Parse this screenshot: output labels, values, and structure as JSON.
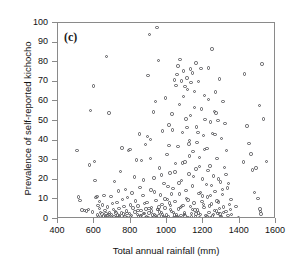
{
  "chart_data": {
    "type": "scatter",
    "title": "",
    "panel_label": "(c)",
    "xlabel": "Total annual rainfall (mm)",
    "ylabel": "Prevalence of self-reported kichocho",
    "xlim": [
      400,
      1600
    ],
    "ylim": [
      0,
      100
    ],
    "xticks": [
      400,
      600,
      800,
      1000,
      1200,
      1400,
      1600
    ],
    "yticks": [
      0,
      10,
      20,
      30,
      40,
      50,
      60,
      70,
      80,
      90,
      100
    ],
    "grid": false,
    "legend": null,
    "marker": "open-circle",
    "marker_color": "#58585c",
    "frame": "box",
    "points": [
      [
        505,
        35.0
      ],
      [
        512,
        11.2
      ],
      [
        520,
        9.5
      ],
      [
        533,
        4.6
      ],
      [
        545,
        4.3
      ],
      [
        556,
        4.1
      ],
      [
        568,
        5.0
      ],
      [
        575,
        27.6
      ],
      [
        580,
        55.5
      ],
      [
        590,
        3.6
      ],
      [
        596,
        67.8
      ],
      [
        600,
        29.4
      ],
      [
        604,
        19.8
      ],
      [
        610,
        10.9
      ],
      [
        614,
        11.6
      ],
      [
        618,
        2.1
      ],
      [
        620,
        6.8
      ],
      [
        624,
        1.2
      ],
      [
        628,
        5.5
      ],
      [
        630,
        9.0
      ],
      [
        634,
        3.4
      ],
      [
        638,
        0.8
      ],
      [
        642,
        2.6
      ],
      [
        646,
        7.2
      ],
      [
        650,
        1.5
      ],
      [
        654,
        12.1
      ],
      [
        658,
        4.4
      ],
      [
        660,
        0.5
      ],
      [
        664,
        2.9
      ],
      [
        668,
        83.0
      ],
      [
        672,
        6.1
      ],
      [
        676,
        1.8
      ],
      [
        680,
        54.0
      ],
      [
        684,
        3.2
      ],
      [
        688,
        0.9
      ],
      [
        692,
        11.4
      ],
      [
        696,
        2.3
      ],
      [
        700,
        7.8
      ],
      [
        704,
        4.9
      ],
      [
        708,
        1.1
      ],
      [
        712,
        19.0
      ],
      [
        716,
        3.7
      ],
      [
        720,
        0.6
      ],
      [
        724,
        8.4
      ],
      [
        728,
        2.0
      ],
      [
        732,
        14.2
      ],
      [
        736,
        5.3
      ],
      [
        740,
        1.7
      ],
      [
        744,
        24.3
      ],
      [
        748,
        3.0
      ],
      [
        752,
        36.2
      ],
      [
        756,
        9.8
      ],
      [
        760,
        2.5
      ],
      [
        764,
        6.4
      ],
      [
        768,
        1.3
      ],
      [
        772,
        15.1
      ],
      [
        776,
        4.0
      ],
      [
        780,
        0.7
      ],
      [
        784,
        11.0
      ],
      [
        788,
        34.8
      ],
      [
        792,
        2.8
      ],
      [
        796,
        35.4
      ],
      [
        800,
        7.1
      ],
      [
        804,
        1.9
      ],
      [
        808,
        13.3
      ],
      [
        812,
        5.7
      ],
      [
        816,
        0.4
      ],
      [
        820,
        21.5
      ],
      [
        824,
        3.5
      ],
      [
        828,
        9.2
      ],
      [
        832,
        30.1
      ],
      [
        836,
        2.2
      ],
      [
        840,
        6.6
      ],
      [
        844,
        1.0
      ],
      [
        848,
        43.3
      ],
      [
        852,
        16.0
      ],
      [
        856,
        4.2
      ],
      [
        860,
        29.7
      ],
      [
        864,
        0.3
      ],
      [
        868,
        11.9
      ],
      [
        872,
        2.7
      ],
      [
        876,
        8.0
      ],
      [
        880,
        38.0
      ],
      [
        884,
        5.1
      ],
      [
        888,
        1.4
      ],
      [
        892,
        42.0
      ],
      [
        896,
        73.2
      ],
      [
        900,
        3.1
      ],
      [
        904,
        94.0
      ],
      [
        908,
        40.5
      ],
      [
        912,
        14.8
      ],
      [
        916,
        6.0
      ],
      [
        920,
        0.9
      ],
      [
        924,
        54.6
      ],
      [
        928,
        21.0
      ],
      [
        932,
        2.4
      ],
      [
        936,
        60.0
      ],
      [
        940,
        9.4
      ],
      [
        944,
        97.8
      ],
      [
        948,
        4.8
      ],
      [
        952,
        80.8
      ],
      [
        956,
        1.6
      ],
      [
        960,
        26.0
      ],
      [
        964,
        12.3
      ],
      [
        968,
        3.3
      ],
      [
        972,
        7.5
      ],
      [
        976,
        45.0
      ],
      [
        980,
        0.5
      ],
      [
        984,
        18.2
      ],
      [
        988,
        5.6
      ],
      [
        992,
        61.8
      ],
      [
        996,
        2.0
      ],
      [
        1000,
        33.0
      ],
      [
        1004,
        10.1
      ],
      [
        1008,
        1.2
      ],
      [
        1012,
        48.0
      ],
      [
        1016,
        23.4
      ],
      [
        1020,
        6.9
      ],
      [
        1024,
        3.8
      ],
      [
        1028,
        53.5
      ],
      [
        1032,
        15.5
      ],
      [
        1036,
        0.8
      ],
      [
        1040,
        71.0
      ],
      [
        1044,
        8.8
      ],
      [
        1048,
        28.3
      ],
      [
        1052,
        2.1
      ],
      [
        1056,
        73.8
      ],
      [
        1060,
        37.0
      ],
      [
        1064,
        5.2
      ],
      [
        1068,
        12.7
      ],
      [
        1072,
        81.5
      ],
      [
        1076,
        1.7
      ],
      [
        1080,
        19.6
      ],
      [
        1084,
        44.2
      ],
      [
        1088,
        7.0
      ],
      [
        1092,
        75.5
      ],
      [
        1096,
        3.0
      ],
      [
        1100,
        29.0
      ],
      [
        1104,
        51.0
      ],
      [
        1108,
        10.5
      ],
      [
        1112,
        66.0
      ],
      [
        1116,
        0.6
      ],
      [
        1120,
        23.0
      ],
      [
        1124,
        40.0
      ],
      [
        1128,
        6.3
      ],
      [
        1132,
        69.5
      ],
      [
        1136,
        2.9
      ],
      [
        1140,
        16.8
      ],
      [
        1144,
        34.5
      ],
      [
        1148,
        8.2
      ],
      [
        1152,
        57.0
      ],
      [
        1156,
        1.1
      ],
      [
        1160,
        25.5
      ],
      [
        1164,
        47.0
      ],
      [
        1168,
        4.5
      ],
      [
        1172,
        70.2
      ],
      [
        1176,
        13.0
      ],
      [
        1180,
        31.5
      ],
      [
        1184,
        2.3
      ],
      [
        1188,
        76.8
      ],
      [
        1192,
        9.0
      ],
      [
        1196,
        20.4
      ],
      [
        1200,
        42.5
      ],
      [
        1204,
        5.8
      ],
      [
        1208,
        63.0
      ],
      [
        1212,
        0.4
      ],
      [
        1216,
        17.5
      ],
      [
        1220,
        36.0
      ],
      [
        1224,
        11.3
      ],
      [
        1228,
        77.0
      ],
      [
        1232,
        3.4
      ],
      [
        1236,
        27.0
      ],
      [
        1240,
        49.5
      ],
      [
        1244,
        7.6
      ],
      [
        1248,
        86.8
      ],
      [
        1252,
        1.5
      ],
      [
        1256,
        22.0
      ],
      [
        1260,
        55.0
      ],
      [
        1264,
        14.0
      ],
      [
        1268,
        64.8
      ],
      [
        1272,
        4.1
      ],
      [
        1276,
        30.8
      ],
      [
        1280,
        50.2
      ],
      [
        1284,
        8.6
      ],
      [
        1288,
        71.5
      ],
      [
        1292,
        2.6
      ],
      [
        1296,
        18.9
      ],
      [
        1300,
        41.0
      ],
      [
        1304,
        12.5
      ],
      [
        1308,
        59.8
      ],
      [
        1312,
        6.2
      ],
      [
        1316,
        26.4
      ],
      [
        1320,
        48.8
      ],
      [
        1324,
        3.7
      ],
      [
        1328,
        34.8
      ],
      [
        1332,
        15.8
      ],
      [
        1336,
        1.9
      ],
      [
        1340,
        18.0
      ],
      [
        1344,
        7.3
      ],
      [
        1348,
        4.7
      ],
      [
        1352,
        10.0
      ],
      [
        1356,
        2.2
      ],
      [
        1380,
        6.4
      ],
      [
        1392,
        0.7
      ],
      [
        1420,
        29.0
      ],
      [
        1428,
        74.0
      ],
      [
        1440,
        47.5
      ],
      [
        1452,
        38.5
      ],
      [
        1462,
        33.2
      ],
      [
        1472,
        25.0
      ],
      [
        1480,
        13.6
      ],
      [
        1490,
        26.0
      ],
      [
        1500,
        10.5
      ],
      [
        1508,
        57.8
      ],
      [
        1512,
        5.2
      ],
      [
        1516,
        3.8
      ],
      [
        1518,
        2.6
      ],
      [
        1522,
        79.0
      ],
      [
        1532,
        51.0
      ],
      [
        1548,
        29.2
      ],
      [
        640,
        0.2
      ],
      [
        660,
        1.0
      ],
      [
        680,
        2.4
      ],
      [
        700,
        0.5
      ],
      [
        720,
        3.0
      ],
      [
        740,
        1.3
      ],
      [
        760,
        0.6
      ],
      [
        780,
        2.8
      ],
      [
        800,
        1.1
      ],
      [
        820,
        0.3
      ],
      [
        840,
        4.2
      ],
      [
        860,
        1.8
      ],
      [
        880,
        0.9
      ],
      [
        900,
        5.5
      ],
      [
        920,
        2.1
      ],
      [
        940,
        0.7
      ],
      [
        960,
        3.6
      ],
      [
        980,
        1.4
      ],
      [
        1000,
        0.2
      ],
      [
        1020,
        4.9
      ],
      [
        1040,
        2.0
      ],
      [
        1060,
        0.8
      ],
      [
        1080,
        6.5
      ],
      [
        1100,
        1.6
      ],
      [
        1120,
        0.4
      ],
      [
        1140,
        5.0
      ],
      [
        1160,
        2.5
      ],
      [
        1180,
        0.9
      ],
      [
        1200,
        7.4
      ],
      [
        1220,
        1.2
      ],
      [
        1240,
        0.6
      ],
      [
        1260,
        4.4
      ],
      [
        1280,
        2.7
      ],
      [
        1300,
        1.0
      ],
      [
        855,
        1.5
      ],
      [
        875,
        2.9
      ],
      [
        895,
        0.8
      ],
      [
        915,
        4.0
      ],
      [
        935,
        1.7
      ],
      [
        955,
        6.2
      ],
      [
        975,
        2.4
      ],
      [
        995,
        0.5
      ],
      [
        1015,
        8.1
      ],
      [
        1035,
        3.3
      ],
      [
        1055,
        1.0
      ],
      [
        1075,
        5.8
      ],
      [
        1095,
        2.2
      ],
      [
        1115,
        9.6
      ],
      [
        1135,
        1.4
      ],
      [
        1155,
        4.6
      ],
      [
        1175,
        3.1
      ],
      [
        1195,
        11.8
      ],
      [
        1215,
        1.9
      ],
      [
        1235,
        6.7
      ],
      [
        1255,
        2.3
      ],
      [
        1275,
        9.1
      ],
      [
        1295,
        1.3
      ],
      [
        1005,
        16.5
      ],
      [
        1025,
        12.8
      ],
      [
        1045,
        24.0
      ],
      [
        1065,
        18.4
      ],
      [
        1085,
        28.6
      ],
      [
        1105,
        14.5
      ],
      [
        1125,
        32.2
      ],
      [
        1145,
        21.8
      ],
      [
        1165,
        39.0
      ],
      [
        1185,
        13.4
      ],
      [
        1205,
        35.5
      ],
      [
        1225,
        24.8
      ],
      [
        1245,
        17.2
      ],
      [
        1265,
        43.0
      ],
      [
        1285,
        20.5
      ],
      [
        1305,
        15.0
      ],
      [
        1325,
        22.6
      ],
      [
        1030,
        45.5
      ],
      [
        1050,
        68.0
      ],
      [
        1070,
        58.5
      ],
      [
        1090,
        62.4
      ],
      [
        1110,
        46.8
      ],
      [
        1130,
        52.8
      ],
      [
        1150,
        65.0
      ],
      [
        1170,
        44.0
      ],
      [
        1190,
        56.2
      ],
      [
        1210,
        50.8
      ],
      [
        1230,
        61.0
      ],
      [
        1250,
        43.5
      ],
      [
        1270,
        54.0
      ],
      [
        870,
        20.0
      ],
      [
        890,
        8.5
      ],
      [
        910,
        31.0
      ],
      [
        930,
        13.8
      ],
      [
        950,
        5.0
      ],
      [
        970,
        22.5
      ],
      [
        990,
        10.2
      ],
      [
        1010,
        37.5
      ],
      [
        1110,
        72.0
      ],
      [
        1130,
        76.5
      ],
      [
        1060,
        78.0
      ],
      [
        1080,
        70.5
      ],
      [
        1100,
        67.5
      ],
      [
        1140,
        74.5
      ],
      [
        1160,
        79.5
      ],
      [
        1120,
        38.2
      ],
      [
        1180,
        26.8
      ],
      [
        1240,
        12.0
      ],
      [
        1290,
        5.4
      ],
      [
        1310,
        3.2
      ]
    ]
  }
}
